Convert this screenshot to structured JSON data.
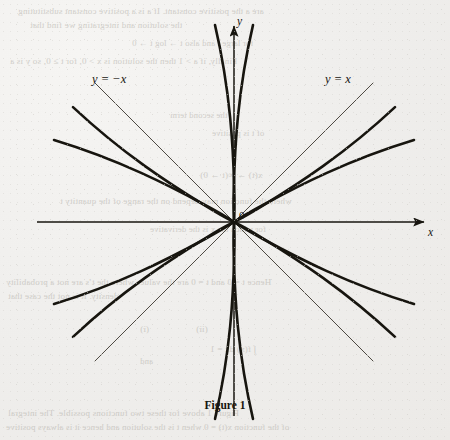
{
  "figure": {
    "caption": "Figure 1",
    "origin_label": "0",
    "axis_x_label": "x",
    "axis_y_label": "y",
    "asymptote_left_label": "y = −x",
    "asymptote_right_label": "y = x",
    "ink_color": "#17150f",
    "thin_line_color": "#3a3630",
    "paper_color": "#f1f0ed"
  },
  "chart_data": {
    "type": "line",
    "title": "Figure 1",
    "xlabel": "x",
    "ylabel": "y",
    "grid": false,
    "legend": null,
    "axis_arrows": [
      "x-positive",
      "y-positive"
    ],
    "origin": {
      "label": "0",
      "px": [
        234,
        222
      ]
    },
    "xlim": [
      -3.2,
      3.2
    ],
    "ylim": [
      -3.2,
      3.2
    ],
    "annotations": [
      {
        "text": "y = −x",
        "px": [
          103,
          80
        ],
        "role": "asymptote-label"
      },
      {
        "text": "y = x",
        "px": [
          337,
          80
        ],
        "role": "asymptote-label"
      },
      {
        "text": "0",
        "px": [
          241,
          216
        ],
        "role": "origin-label"
      },
      {
        "text": "x",
        "px": [
          432,
          234
        ],
        "role": "axis-label"
      },
      {
        "text": "y",
        "px": [
          240,
          24
        ],
        "role": "axis-label"
      }
    ],
    "series": [
      {
        "name": "hyperbola-1-branch-right",
        "vertex": [
          1,
          0
        ],
        "opens": "right",
        "asymptote_slopes": [
          1,
          -1
        ]
      },
      {
        "name": "hyperbola-1-branch-left",
        "vertex": [
          -1,
          0
        ],
        "opens": "left",
        "asymptote_slopes": [
          1,
          -1
        ]
      },
      {
        "name": "hyperbola-2-branch-upper",
        "vertex": [
          0.5,
          0.866
        ],
        "opens": "up-right",
        "asymptote_slopes": [
          0,
          1.732
        ]
      },
      {
        "name": "hyperbola-2-branch-lower",
        "vertex": [
          -0.5,
          -0.866
        ],
        "opens": "down-left",
        "asymptote_slopes": [
          0,
          1.732
        ]
      },
      {
        "name": "hyperbola-3-branch-upper",
        "vertex": [
          -0.5,
          0.866
        ],
        "opens": "up-left",
        "asymptote_slopes": [
          0,
          -1.732
        ]
      },
      {
        "name": "hyperbola-3-branch-lower",
        "vertex": [
          0.5,
          -0.866
        ],
        "opens": "down-right",
        "asymptote_slopes": [
          0,
          -1.732
        ]
      }
    ],
    "asymptote_lines": [
      {
        "label": "y = x",
        "slope": 1
      },
      {
        "label": "y = −x",
        "slope": -1
      }
    ]
  },
  "bleed_through": {
    "lines": [
      {
        "text": "are a the positive constant.  If a is a positive constant substituting",
        "x": 18,
        "y": 6,
        "size": 9.0
      },
      {
        "text": "the solution and integrating we find that",
        "x": 30,
        "y": 20,
        "size": 9.0
      },
      {
        "text": "for large  t  and also  t → log  t → 0",
        "x": 132,
        "y": 38,
        "size": 8.6
      },
      {
        "text": "Finally, if  a > 1  then the solution is  x > 0, for  t ≥ 0, so  y  is a",
        "x": 10,
        "y": 56,
        "size": 9.0
      },
      {
        "text": "the second term",
        "x": 170,
        "y": 110,
        "size": 8.6
      },
      {
        "text": "of  t  is positive",
        "x": 212,
        "y": 128,
        "size": 8.6
      },
      {
        "text": "x(t) → ∞(t → 0)",
        "x": 200,
        "y": 170,
        "size": 9.0
      },
      {
        "text": "where the function may depend on the range of the quantity  t",
        "x": 60,
        "y": 196,
        "size": 9.0
      },
      {
        "text": "for which the  x  is the derivative",
        "x": 150,
        "y": 224,
        "size": 8.6
      },
      {
        "text": "Hence  t = 0  and  t = 0  are the values  where the  t’s  are  not  a  probability",
        "x": 6,
        "y": 277,
        "size": 9.0
      },
      {
        "text": "density.  It  is  not  the  case  that",
        "x": 8,
        "y": 291,
        "size": 9.0
      },
      {
        "text": "(i)",
        "x": 140,
        "y": 324,
        "size": 9.0
      },
      {
        "text": "(ii)",
        "x": 196,
        "y": 324,
        "size": 9.0
      },
      {
        "text": "∫ f(x) dx = 1",
        "x": 210,
        "y": 344,
        "size": 9.0
      },
      {
        "text": "and",
        "x": 140,
        "y": 356,
        "size": 8.6
      },
      {
        "text": "Figure  1  above  for  these  two  functions  possible.   The  integral",
        "x": 8,
        "y": 408,
        "size": 9.0
      },
      {
        "text": "of  the  function  x(t) = 0  when  t  is  the  solution  and  hence  it  is  always  positive",
        "x": 6,
        "y": 422,
        "size": 8.8
      }
    ]
  }
}
